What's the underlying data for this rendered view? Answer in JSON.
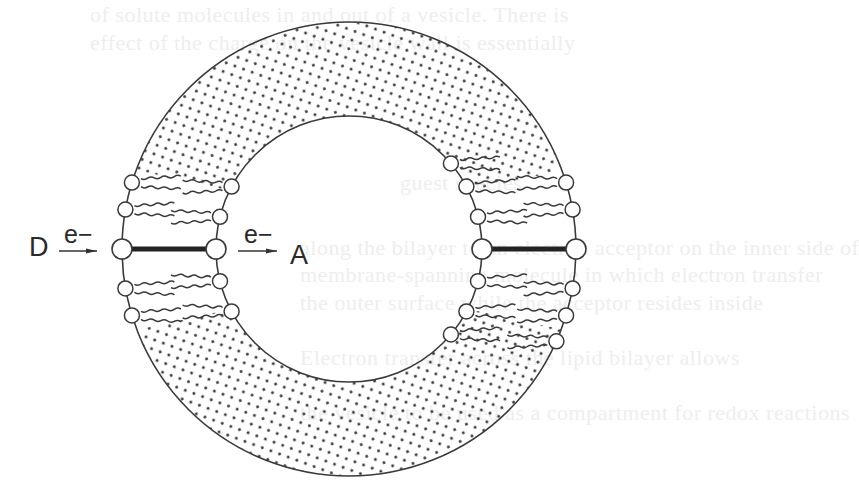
{
  "figure": {
    "colors": {
      "line": "#3a3a3a",
      "dots": "#3c3c3c",
      "background": "#ffffff",
      "bleed_through_text": "#eeeeee"
    },
    "geometry": {
      "center": [
        349,
        249
      ],
      "outer_radius": 227,
      "inner_radius": 133
    },
    "labels": {
      "donor": "D",
      "acceptor": "A",
      "electron_outer": "e−",
      "electron_inner": "e−"
    },
    "bleed_through": [
      "of solute molecules in and out of a vesicle. There is",
      "effect of the charge on the vesicle wall is essentially",
      "guest species",
      "along the bilayer to an electron acceptor on the inner side of",
      "membrane-spanning molecule in which electron transfer",
      "the outer surface while the acceptor resides inside",
      "Electron transfer across the lipid bilayer allows",
      "the vesicle to be used as a compartment for redox reactions"
    ]
  }
}
